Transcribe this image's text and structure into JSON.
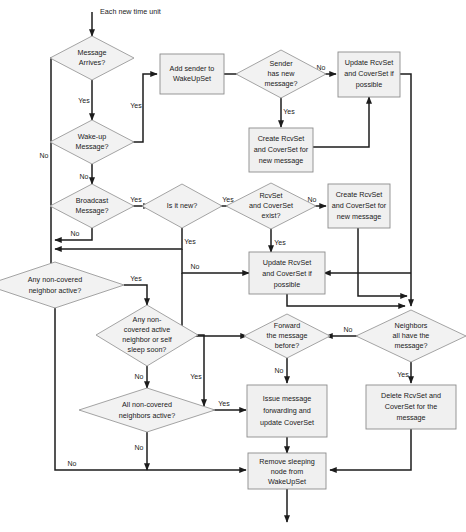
{
  "diagram": {
    "start_label": "Each new time unit",
    "colors": {
      "node_fill": "#f0f0f0",
      "node_stroke": "#8c8c8c",
      "decision_fill": "#f2f2f2",
      "decision_stroke": "#9a9a9a",
      "edge": "#1c1c1c",
      "text": "#1a1a1a",
      "background": "#ffffff"
    },
    "nodes": [
      {
        "id": "msg_arrives",
        "type": "decision",
        "lines": [
          "Message",
          "Arrives?"
        ]
      },
      {
        "id": "wakeup_msg",
        "type": "decision",
        "lines": [
          "Wake-up",
          "Message?"
        ]
      },
      {
        "id": "broadcast_msg",
        "type": "decision",
        "lines": [
          "Broadcast",
          "Message?"
        ]
      },
      {
        "id": "add_sender",
        "type": "process",
        "lines": [
          "Add sender to",
          "WakeUpSet"
        ]
      },
      {
        "id": "sender_has_new",
        "type": "decision",
        "lines": [
          "Sender",
          "has new",
          "message?"
        ]
      },
      {
        "id": "update_cover_1",
        "type": "process",
        "lines": [
          "Update RcvSet",
          "and CoverSet if",
          "possible"
        ]
      },
      {
        "id": "create_cover_1",
        "type": "process",
        "lines": [
          "Create RcvSet",
          "and CoverSet for",
          "new message"
        ]
      },
      {
        "id": "is_it_new",
        "type": "decision",
        "lines": [
          "Is it new?"
        ]
      },
      {
        "id": "rcvset_exist",
        "type": "decision",
        "lines": [
          "RcvSet",
          "and CoverSet",
          "exist?"
        ]
      },
      {
        "id": "create_cover_2",
        "type": "process",
        "lines": [
          "Create RcvSet",
          "and CoverSet for",
          "new message"
        ]
      },
      {
        "id": "update_cover_2",
        "type": "process",
        "lines": [
          "Update RcvSet",
          "and CoverSet if",
          "possible"
        ]
      },
      {
        "id": "any_noncov",
        "type": "decision",
        "lines": [
          "Any non-covered",
          "neighbor active?"
        ]
      },
      {
        "id": "any_noncov_sleep",
        "type": "decision",
        "lines": [
          "Any non-",
          "covered active",
          "neighbor or self",
          "sleep soon?"
        ]
      },
      {
        "id": "all_noncov",
        "type": "decision",
        "lines": [
          "All non-covered",
          "neighbors active?"
        ]
      },
      {
        "id": "forward_before",
        "type": "decision",
        "lines": [
          "Forward",
          "the message",
          "before?"
        ]
      },
      {
        "id": "neighbors_have",
        "type": "decision",
        "lines": [
          "Neighbors",
          "all have the",
          "message?"
        ]
      },
      {
        "id": "issue_forward",
        "type": "process",
        "lines": [
          "Issue message",
          "forwarding and",
          "update CoverSet"
        ]
      },
      {
        "id": "delete_sets",
        "type": "process",
        "lines": [
          "Delete RcvSet and",
          "CoverSet for the",
          "message"
        ]
      },
      {
        "id": "remove_sleeping",
        "type": "process",
        "lines": [
          "Remove sleeping",
          "node from",
          "WakeUpSet"
        ]
      }
    ],
    "edges": [
      {
        "from": "start",
        "to": "msg_arrives",
        "label": ""
      },
      {
        "from": "msg_arrives",
        "to": "wakeup_msg",
        "label": "Yes"
      },
      {
        "from": "msg_arrives",
        "to": "any_noncov",
        "label": "No"
      },
      {
        "from": "wakeup_msg",
        "to": "add_sender",
        "label": "Yes"
      },
      {
        "from": "wakeup_msg",
        "to": "broadcast_msg",
        "label": "No"
      },
      {
        "from": "add_sender",
        "to": "sender_has_new",
        "label": ""
      },
      {
        "from": "sender_has_new",
        "to": "update_cover_1",
        "label": "No"
      },
      {
        "from": "sender_has_new",
        "to": "create_cover_1",
        "label": "Yes"
      },
      {
        "from": "create_cover_1",
        "to": "update_cover_1",
        "label": ""
      },
      {
        "from": "broadcast_msg",
        "to": "is_it_new",
        "label": "Yes"
      },
      {
        "from": "broadcast_msg",
        "to": "any_noncov",
        "label": "No"
      },
      {
        "from": "is_it_new",
        "to": "rcvset_exist",
        "label": "Yes"
      },
      {
        "from": "is_it_new",
        "to": "any_noncov",
        "label": "Yes"
      },
      {
        "from": "rcvset_exist",
        "to": "create_cover_2",
        "label": "No"
      },
      {
        "from": "rcvset_exist",
        "to": "update_cover_2",
        "label": "Yes"
      },
      {
        "from": "is_it_new",
        "to": "update_cover_2",
        "label": "No"
      },
      {
        "from": "create_cover_2",
        "to": "neighbors_have",
        "label": ""
      },
      {
        "from": "update_cover_1",
        "to": "neighbors_have",
        "label": ""
      },
      {
        "from": "update_cover_2",
        "to": "neighbors_have",
        "label": ""
      },
      {
        "from": "any_noncov",
        "to": "any_noncov_sleep",
        "label": "Yes"
      },
      {
        "from": "any_noncov",
        "to": "remove_sleeping",
        "label": "No"
      },
      {
        "from": "any_noncov_sleep",
        "to": "all_noncov",
        "label": "No"
      },
      {
        "from": "any_noncov_sleep",
        "to": "issue_forward",
        "label": "Yes"
      },
      {
        "from": "all_noncov",
        "to": "issue_forward",
        "label": "Yes"
      },
      {
        "from": "all_noncov",
        "to": "remove_sleeping",
        "label": "No"
      },
      {
        "from": "neighbors_have",
        "to": "forward_before",
        "label": "No"
      },
      {
        "from": "neighbors_have",
        "to": "delete_sets",
        "label": "Yes"
      },
      {
        "from": "forward_before",
        "to": "issue_forward",
        "label": "No"
      },
      {
        "from": "delete_sets",
        "to": "remove_sleeping",
        "label": ""
      },
      {
        "from": "issue_forward",
        "to": "remove_sleeping",
        "label": ""
      },
      {
        "from": "remove_sleeping",
        "to": "end",
        "label": ""
      }
    ],
    "labels": {
      "yes": "Yes",
      "no": "No"
    }
  }
}
